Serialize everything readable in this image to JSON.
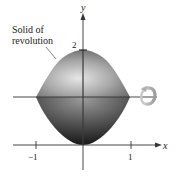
{
  "figure": {
    "callout": {
      "line1": "Solid of",
      "line2": "revolution"
    },
    "axes": {
      "x_label": "x",
      "y_label": "y",
      "x_ticks": [
        "−1",
        "1"
      ],
      "y_ticks": [
        "2"
      ]
    },
    "icons": {
      "rotation": "rotation-arrow-icon"
    },
    "colors": {
      "solid_light": "#d9d9d9",
      "solid_mid": "#8a8a8a",
      "solid_dark": "#2e2e2e",
      "axis": "#333333",
      "rotation_arrow": "#b8b8b8"
    }
  }
}
